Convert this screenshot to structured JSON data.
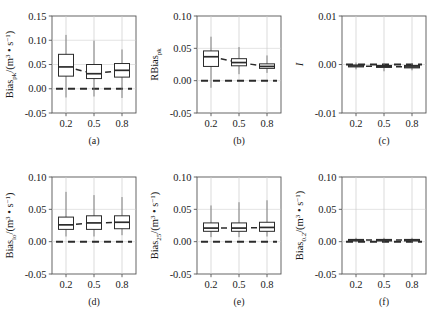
{
  "figure": {
    "background": "#ffffff",
    "line_color": "#2b2b2b",
    "axis_color": "#555555",
    "grid_color": "#cccccc",
    "rows": 2,
    "cols": 3
  },
  "chart_data": [
    {
      "type": "box",
      "panel": "a",
      "caption": "(a)",
      "title": "",
      "xlabel": "",
      "ylabel": "Bias/(m³ • s⁻¹)",
      "ylabel_base": "Bias",
      "ylabel_sub": "pk",
      "ylabel_unit": "/(m³ • s⁻¹)",
      "categories": [
        "0.2",
        "0.5",
        "0.8"
      ],
      "x": [
        0.2,
        0.5,
        0.8
      ],
      "xlim": [
        0.05,
        0.95
      ],
      "ylim": [
        -0.05,
        0.15
      ],
      "yticks": [
        -0.05,
        0.0,
        0.05,
        0.1,
        0.15
      ],
      "yticklabels": [
        "-0.05",
        "0.00",
        "0.05",
        "0.10",
        "0.15"
      ],
      "xticks": [
        0.2,
        0.5,
        0.8
      ],
      "xticklabels": [
        "0.2",
        "0.5",
        "0.8"
      ],
      "grid": true,
      "reference_line": 0.0,
      "boxes": [
        {
          "category": "0.2",
          "whisker_low": -0.018,
          "q1": 0.026,
          "median": 0.045,
          "q3": 0.071,
          "whisker_high": 0.111
        },
        {
          "category": "0.5",
          "whisker_low": -0.016,
          "q1": 0.021,
          "median": 0.031,
          "q3": 0.05,
          "whisker_high": 0.099
        },
        {
          "category": "0.8",
          "whisker_low": -0.019,
          "q1": 0.024,
          "median": 0.038,
          "q3": 0.052,
          "whisker_high": 0.081
        }
      ],
      "trend_values": [
        0.045,
        0.031,
        0.038
      ]
    },
    {
      "type": "box",
      "panel": "b",
      "caption": "(b)",
      "title": "",
      "xlabel": "",
      "ylabel": "RBias",
      "ylabel_base": "RBias",
      "ylabel_sub": "pk",
      "ylabel_unit": "",
      "categories": [
        "0.2",
        "0.5",
        "0.8"
      ],
      "x": [
        0.2,
        0.5,
        0.8
      ],
      "xlim": [
        0.05,
        0.95
      ],
      "ylim": [
        -0.05,
        0.1
      ],
      "yticks": [
        -0.05,
        0.0,
        0.05,
        0.1
      ],
      "yticklabels": [
        "-0.05",
        "0.00",
        "0.05",
        "0.10"
      ],
      "xticks": [
        0.2,
        0.5,
        0.8
      ],
      "xticklabels": [
        "0.2",
        "0.5",
        "0.8"
      ],
      "grid": true,
      "reference_line": 0.0,
      "boxes": [
        {
          "category": "0.2",
          "whisker_low": -0.011,
          "q1": 0.022,
          "median": 0.037,
          "q3": 0.046,
          "whisker_high": 0.068
        },
        {
          "category": "0.5",
          "whisker_low": 0.01,
          "q1": 0.023,
          "median": 0.028,
          "q3": 0.034,
          "whisker_high": 0.052
        },
        {
          "category": "0.8",
          "whisker_low": 0.012,
          "q1": 0.019,
          "median": 0.022,
          "q3": 0.026,
          "whisker_high": 0.039
        }
      ],
      "trend_values": [
        0.037,
        0.028,
        0.022
      ]
    },
    {
      "type": "box",
      "panel": "c",
      "caption": "(c)",
      "title": "",
      "xlabel": "",
      "ylabel": "I",
      "ylabel_base": "I",
      "ylabel_sub": "",
      "ylabel_unit": "",
      "categories": [
        "0.2",
        "0.5",
        "0.8"
      ],
      "x": [
        0.2,
        0.5,
        0.8
      ],
      "xlim": [
        0.05,
        0.95
      ],
      "ylim": [
        -0.01,
        0.01
      ],
      "yticks": [
        -0.01,
        0.0,
        0.01
      ],
      "yticklabels": [
        "-0.01",
        "0.00",
        "0.01"
      ],
      "xticks": [
        0.2,
        0.5,
        0.8
      ],
      "xticklabels": [
        "0.2",
        "0.5",
        "0.8"
      ],
      "grid": true,
      "reference_line": 0.0,
      "boxes": [
        {
          "category": "0.2",
          "whisker_low": -0.001,
          "q1": -0.0005,
          "median": -0.0003,
          "q3": -0.0001,
          "whisker_high": 0.0004
        },
        {
          "category": "0.5",
          "whisker_low": -0.0014,
          "q1": -0.0006,
          "median": -0.0004,
          "q3": -0.0002,
          "whisker_high": 0.0002
        },
        {
          "category": "0.8",
          "whisker_low": -0.0012,
          "q1": -0.0007,
          "median": -0.0005,
          "q3": -0.0002,
          "whisker_high": 0.0003
        }
      ],
      "trend_values": [
        -0.0003,
        -0.0004,
        -0.0005
      ]
    },
    {
      "type": "box",
      "panel": "d",
      "caption": "(d)",
      "title": "",
      "xlabel": "",
      "ylabel": "Bias/(m³ • s⁻¹)",
      "ylabel_base": "Bias",
      "ylabel_sub": "lo",
      "ylabel_unit": "/(m³ • s⁻¹)",
      "categories": [
        "0.2",
        "0.5",
        "0.8"
      ],
      "x": [
        0.2,
        0.5,
        0.8
      ],
      "xlim": [
        0.05,
        0.95
      ],
      "ylim": [
        -0.05,
        0.1
      ],
      "yticks": [
        -0.05,
        0.0,
        0.05,
        0.1
      ],
      "yticklabels": [
        "-0.05",
        "0.00",
        "0.05",
        "0.10"
      ],
      "xticks": [
        0.2,
        0.5,
        0.8
      ],
      "xticklabels": [
        "0.2",
        "0.5",
        "0.8"
      ],
      "grid": true,
      "reference_line": 0.0,
      "boxes": [
        {
          "category": "0.2",
          "whisker_low": 0.008,
          "q1": 0.019,
          "median": 0.026,
          "q3": 0.038,
          "whisker_high": 0.077
        },
        {
          "category": "0.5",
          "whisker_low": 0.008,
          "q1": 0.019,
          "median": 0.029,
          "q3": 0.04,
          "whisker_high": 0.072
        },
        {
          "category": "0.8",
          "whisker_low": 0.01,
          "q1": 0.02,
          "median": 0.03,
          "q3": 0.04,
          "whisker_high": 0.069
        }
      ],
      "trend_values": [
        0.026,
        0.029,
        0.03
      ]
    },
    {
      "type": "box",
      "panel": "e",
      "caption": "(e)",
      "title": "",
      "xlabel": "",
      "ylabel": "Bias/(m³ • s⁻¹)",
      "ylabel_base": "Bias",
      "ylabel_sub": "25",
      "ylabel_unit": "/(m³ • s⁻¹)",
      "categories": [
        "0.2",
        "0.5",
        "0.8"
      ],
      "x": [
        0.2,
        0.5,
        0.8
      ],
      "xlim": [
        0.05,
        0.95
      ],
      "ylim": [
        -0.05,
        0.1
      ],
      "yticks": [
        -0.05,
        0.0,
        0.05,
        0.1
      ],
      "yticklabels": [
        "-0.05",
        "0.00",
        "0.05",
        "0.10"
      ],
      "xticks": [
        0.2,
        0.5,
        0.8
      ],
      "xticklabels": [
        "0.2",
        "0.5",
        "0.8"
      ],
      "grid": true,
      "reference_line": 0.0,
      "boxes": [
        {
          "category": "0.2",
          "whisker_low": 0.007,
          "q1": 0.016,
          "median": 0.021,
          "q3": 0.029,
          "whisker_high": 0.056
        },
        {
          "category": "0.5",
          "whisker_low": 0.007,
          "q1": 0.016,
          "median": 0.021,
          "q3": 0.029,
          "whisker_high": 0.061
        },
        {
          "category": "0.8",
          "whisker_low": 0.008,
          "q1": 0.016,
          "median": 0.022,
          "q3": 0.03,
          "whisker_high": 0.064
        }
      ],
      "trend_values": [
        0.021,
        0.021,
        0.022
      ]
    },
    {
      "type": "box",
      "panel": "f",
      "caption": "(f)",
      "title": "",
      "xlabel": "",
      "ylabel": "Bias/(m³ • s⁻¹)",
      "ylabel_base": "Bias",
      "ylabel_sub": "0.2",
      "ylabel_unit": "/(m³ • s⁻¹)",
      "categories": [
        "0.2",
        "0.5",
        "0.8"
      ],
      "x": [
        0.2,
        0.5,
        0.8
      ],
      "xlim": [
        0.05,
        0.95
      ],
      "ylim": [
        -0.05,
        0.1
      ],
      "yticks": [
        -0.05,
        0.0,
        0.05,
        0.1
      ],
      "yticklabels": [
        "-0.05",
        "0.00",
        "0.05",
        "0.10"
      ],
      "xticks": [
        0.2,
        0.5,
        0.8
      ],
      "xticklabels": [
        "0.2",
        "0.5",
        "0.8"
      ],
      "grid": true,
      "reference_line": 0.0,
      "boxes": [
        {
          "category": "0.2",
          "whisker_low": -0.001,
          "q1": 0.0015,
          "median": 0.0025,
          "q3": 0.0035,
          "whisker_high": 0.006
        },
        {
          "category": "0.5",
          "whisker_low": -0.001,
          "q1": 0.0015,
          "median": 0.0025,
          "q3": 0.0035,
          "whisker_high": 0.006
        },
        {
          "category": "0.8",
          "whisker_low": -0.001,
          "q1": 0.0015,
          "median": 0.0025,
          "q3": 0.0035,
          "whisker_high": 0.006
        }
      ],
      "trend_values": [
        0.0025,
        0.0025,
        0.0025
      ]
    }
  ]
}
